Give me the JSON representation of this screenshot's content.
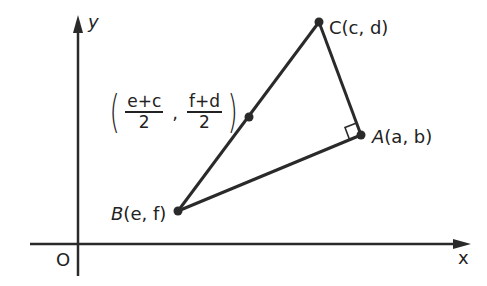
{
  "diagram": {
    "type": "coordinate-geometry",
    "axes": {
      "x_label": "x",
      "y_label": "y",
      "origin_label": "O"
    },
    "points": {
      "A": {
        "label": "A(a, b)",
        "name": "A",
        "coords": "(a, b)"
      },
      "B": {
        "label": "B(e, f)",
        "name": "B",
        "coords": "(e, f)"
      },
      "C": {
        "label": "C(c, d)",
        "name": "C",
        "coords": "(c, d)"
      }
    },
    "midpoint": {
      "x_num": "e+c",
      "x_den": "2",
      "y_num": "f+d",
      "y_den": "2",
      "comma": ","
    },
    "right_angle_at": "A",
    "colors": {
      "stroke": "#2a2a2a",
      "text": "#222222",
      "background": "#ffffff"
    }
  }
}
